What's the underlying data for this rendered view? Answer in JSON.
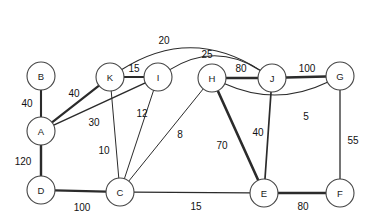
{
  "diagram": {
    "type": "node-link-graph",
    "canvas": {
      "width": 378,
      "height": 224,
      "background": "#ffffff"
    },
    "node_radius": 14,
    "stroke_color": "#2b2b2b",
    "node_fill": "#ffffff",
    "node_stroke": "#444444",
    "nodes": [
      {
        "id": "B",
        "label": "B",
        "x": 41,
        "y": 76
      },
      {
        "id": "A",
        "label": "A",
        "x": 41,
        "y": 131
      },
      {
        "id": "D",
        "label": "D",
        "x": 41,
        "y": 190
      },
      {
        "id": "K",
        "label": "K",
        "x": 110,
        "y": 77
      },
      {
        "id": "I",
        "label": "I",
        "x": 158,
        "y": 77
      },
      {
        "id": "H",
        "label": "H",
        "x": 212,
        "y": 78
      },
      {
        "id": "J",
        "label": "J",
        "x": 272,
        "y": 78
      },
      {
        "id": "G",
        "label": "G",
        "x": 340,
        "y": 76
      },
      {
        "id": "C",
        "label": "C",
        "x": 120,
        "y": 192
      },
      {
        "id": "E",
        "label": "E",
        "x": 264,
        "y": 193
      },
      {
        "id": "F",
        "label": "F",
        "x": 340,
        "y": 193
      }
    ],
    "edges": [
      {
        "id": "B-A",
        "source": "B",
        "target": "A",
        "weight": 40,
        "weight_label": "40",
        "thickness": 2.1,
        "curve": 0,
        "label_x": 27,
        "label_y": 103
      },
      {
        "id": "A-D",
        "source": "A",
        "target": "D",
        "weight": 120,
        "weight_label": "120",
        "thickness": 2.4,
        "curve": 0,
        "label_x": 23,
        "label_y": 161
      },
      {
        "id": "A-K",
        "source": "A",
        "target": "K",
        "weight": 40,
        "weight_label": "40",
        "thickness": 2.2,
        "curve": 0,
        "label_x": 74,
        "label_y": 93
      },
      {
        "id": "A-I",
        "source": "A",
        "target": "I",
        "weight": 30,
        "weight_label": "30",
        "thickness": 1.5,
        "curve": 0,
        "label_x": 94,
        "label_y": 122
      },
      {
        "id": "K-I",
        "source": "K",
        "target": "I",
        "weight": 15,
        "weight_label": "15",
        "thickness": 1.8,
        "curve": 0,
        "label_x": 134,
        "label_y": 68
      },
      {
        "id": "K-C",
        "source": "K",
        "target": "C",
        "weight": 10,
        "weight_label": "10",
        "thickness": 1.0,
        "curve": 0,
        "label_x": 104,
        "label_y": 150
      },
      {
        "id": "I-C",
        "source": "I",
        "target": "C",
        "weight": 12,
        "weight_label": "12",
        "thickness": 1.0,
        "curve": 0,
        "label_x": 142,
        "label_y": 113
      },
      {
        "id": "H-C",
        "source": "H",
        "target": "C",
        "weight": 8,
        "weight_label": "8",
        "thickness": 1.0,
        "curve": 0,
        "label_x": 180,
        "label_y": 134
      },
      {
        "id": "H-J",
        "source": "H",
        "target": "J",
        "weight": 80,
        "weight_label": "80",
        "thickness": 2.5,
        "curve": 0,
        "label_x": 241,
        "label_y": 68
      },
      {
        "id": "J-G",
        "source": "J",
        "target": "G",
        "weight": 100,
        "weight_label": "100",
        "thickness": 2.5,
        "curve": 0,
        "label_x": 307,
        "label_y": 68
      },
      {
        "id": "H-E",
        "source": "H",
        "target": "E",
        "weight": 70,
        "weight_label": "70",
        "thickness": 2.6,
        "curve": 0,
        "label_x": 222,
        "label_y": 145
      },
      {
        "id": "J-E",
        "source": "J",
        "target": "E",
        "weight": 40,
        "weight_label": "40",
        "thickness": 1.7,
        "curve": 0,
        "label_x": 258,
        "label_y": 132
      },
      {
        "id": "G-F",
        "source": "G",
        "target": "F",
        "weight": 55,
        "weight_label": "55",
        "thickness": 1.3,
        "curve": 0,
        "label_x": 353,
        "label_y": 140
      },
      {
        "id": "D-C",
        "source": "D",
        "target": "C",
        "weight": 100,
        "weight_label": "100",
        "thickness": 2.4,
        "curve": 0,
        "label_x": 82,
        "label_y": 207
      },
      {
        "id": "C-E",
        "source": "C",
        "target": "E",
        "weight": 15,
        "weight_label": "15",
        "thickness": 1.1,
        "curve": 0,
        "label_x": 196,
        "label_y": 206
      },
      {
        "id": "E-F",
        "source": "E",
        "target": "F",
        "weight": 80,
        "weight_label": "80",
        "thickness": 2.4,
        "curve": 0,
        "label_x": 303,
        "label_y": 206
      },
      {
        "id": "K-J",
        "source": "K",
        "target": "J",
        "weight": 20,
        "weight_label": "20",
        "thickness": 1.1,
        "curve": -52,
        "label_x": 164,
        "label_y": 40
      },
      {
        "id": "I-J",
        "source": "I",
        "target": "J",
        "weight": 25,
        "weight_label": "25",
        "thickness": 1.1,
        "curve": -36,
        "label_x": 207,
        "label_y": 54
      },
      {
        "id": "H-G",
        "source": "H",
        "target": "G",
        "weight": 5,
        "weight_label": "5",
        "thickness": 1.1,
        "curve": 30,
        "label_x": 306,
        "label_y": 116
      }
    ]
  }
}
